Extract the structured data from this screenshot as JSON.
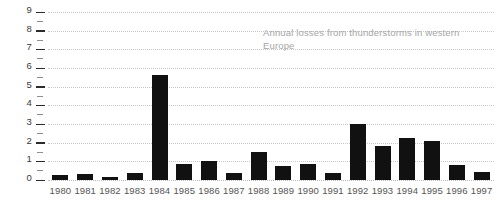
{
  "chart_data": {
    "type": "bar",
    "title": "",
    "subtitle": "",
    "annotation": "Annual losses from thunderstorms in western Europe",
    "xlabel": "",
    "ylabel": "",
    "ylim": [
      0,
      9
    ],
    "xlim_categories": 18,
    "grid": true,
    "legend": false,
    "bar_color": "#111111",
    "gridline_color": "#c9c9c9",
    "tick_color": "#2b2b2b",
    "annotation_color": "#a6a6a6",
    "axis_label_color": "#555555",
    "y_ticks": [
      0,
      1,
      2,
      3,
      4,
      5,
      6,
      7,
      8,
      9
    ],
    "y_minor_ticks": [
      0.5,
      1.5,
      2.5,
      3.5,
      4.5,
      5.5,
      6.5,
      7.5,
      8.5
    ],
    "categories": [
      "1980",
      "1981",
      "1982",
      "1983",
      "1984",
      "1985",
      "1986",
      "1987",
      "1988",
      "1989",
      "1990",
      "1991",
      "1992",
      "1993",
      "1994",
      "1995",
      "1996",
      "1997"
    ],
    "values": [
      0.25,
      0.3,
      0.15,
      0.35,
      5.6,
      0.85,
      1.0,
      0.4,
      1.5,
      0.75,
      0.85,
      0.4,
      3.0,
      1.8,
      2.25,
      2.1,
      0.8,
      0.45
    ]
  }
}
